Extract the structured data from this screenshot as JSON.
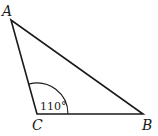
{
  "diagram": {
    "type": "triangle",
    "vertices": {
      "A": {
        "label": "A"
      },
      "B": {
        "label": "B"
      },
      "C": {
        "label": "C"
      }
    },
    "angle": {
      "vertex": "C",
      "label": "110°",
      "value_degrees": 110
    },
    "colors": {
      "stroke": "#1a1a1a",
      "background": "#ffffff"
    }
  }
}
